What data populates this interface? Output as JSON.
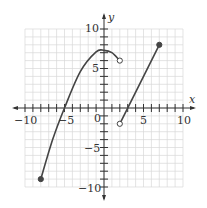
{
  "chart_data": {
    "type": "line",
    "title": "",
    "xlabel": "x",
    "ylabel": "y",
    "xlim": [
      -10,
      10
    ],
    "ylim": [
      -10,
      10
    ],
    "grid": true,
    "x_ticks": [
      -10,
      -5,
      0,
      5,
      10
    ],
    "y_ticks": [
      -10,
      -5,
      5,
      10
    ],
    "x_tick_labels": [
      "−10",
      "−5",
      "0",
      "5",
      "10"
    ],
    "y_tick_labels": [
      "−10",
      "−5",
      "5",
      "10"
    ],
    "series": [
      {
        "name": "curve-piece",
        "shape": "curve",
        "points": [
          [
            -8,
            -9
          ],
          [
            -6.5,
            -4
          ],
          [
            -5,
            0
          ],
          [
            -3,
            4.6
          ],
          [
            -1,
            7.1
          ],
          [
            0,
            7.3
          ],
          [
            1,
            7.0
          ],
          [
            2,
            6
          ]
        ],
        "start": {
          "x": -8,
          "y": -9,
          "closed": true
        },
        "end": {
          "x": 2,
          "y": 6,
          "closed": false
        }
      },
      {
        "name": "line-piece",
        "shape": "line",
        "points": [
          [
            2,
            -2
          ],
          [
            7,
            8
          ]
        ],
        "start": {
          "x": 2,
          "y": -2,
          "closed": false
        },
        "end": {
          "x": 7,
          "y": 8,
          "closed": true
        }
      }
    ]
  },
  "labels": {
    "x_axis": "x",
    "y_axis": "y",
    "origin": "0",
    "x_neg10": "−10",
    "x_neg5": "−5",
    "x_pos5": "5",
    "x_pos10": "10",
    "y_pos10": "10",
    "y_pos5": "5",
    "y_neg5": "−5",
    "y_neg10": "−10"
  },
  "colors": {
    "grid": "#d8d8d8",
    "axis": "#333333",
    "curve": "#444444"
  }
}
